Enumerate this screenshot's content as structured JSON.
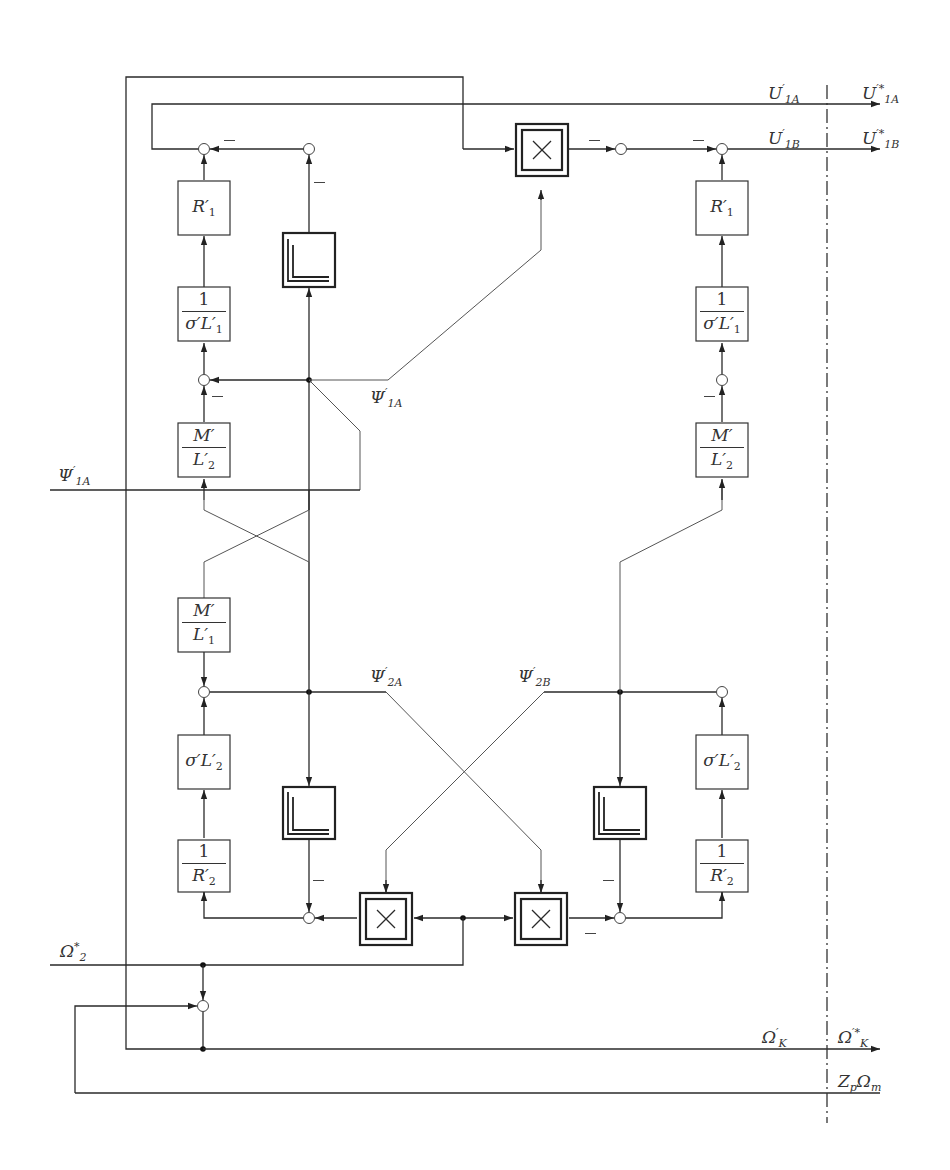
{
  "diagram": {
    "blocks": {
      "r1_left": {
        "label": "R",
        "prime": "′",
        "sub": "1"
      },
      "r1_right": {
        "label": "R",
        "prime": "′",
        "sub": "1"
      },
      "inv_sigma_l1_left": {
        "num": "1",
        "den": "σ′L′",
        "den_sub": "1"
      },
      "inv_sigma_l1_right": {
        "num": "1",
        "den": "σ′L′",
        "den_sub": "1"
      },
      "m_l2_left": {
        "num": "M′",
        "den": "L′",
        "den_sub": "2"
      },
      "m_l2_right": {
        "num": "M′",
        "den": "L′",
        "den_sub": "2"
      },
      "m_l1_left": {
        "num": "M′",
        "den": "L′",
        "den_sub": "1"
      },
      "sigma_l2_left": {
        "label": "σ′L′",
        "sub": "2"
      },
      "sigma_l2_right": {
        "label": "σ′L′",
        "sub": "2"
      },
      "inv_r2_left": {
        "num": "1",
        "den": "R′",
        "den_sub": "2"
      },
      "inv_r2_right": {
        "num": "1",
        "den": "R′",
        "den_sub": "2"
      },
      "integrator_top": {
        "type": "integrator"
      },
      "integrator_bottom_left": {
        "type": "integrator"
      },
      "integrator_bottom_right": {
        "type": "integrator"
      },
      "multiplier_top": {
        "type": "multiplier",
        "symbol": "×"
      },
      "multiplier_bottom_left": {
        "type": "multiplier",
        "symbol": "×"
      },
      "multiplier_bottom_right": {
        "type": "multiplier",
        "symbol": "×"
      }
    },
    "signals": {
      "u1a": {
        "main": "U",
        "sup": "′",
        "sub": "1A"
      },
      "u1a_star": {
        "main": "U",
        "sup": "′*",
        "sub": "1A"
      },
      "u1b": {
        "main": "U",
        "sup": "′",
        "sub": "1B"
      },
      "u1b_star": {
        "main": "U",
        "sup": "′*",
        "sub": "1B"
      },
      "psi1a_mid": {
        "main": "Ψ",
        "sup": "′",
        "sub": "1A"
      },
      "psi1a_in": {
        "main": "Ψ",
        "sup": "′",
        "sub": "1A"
      },
      "psi2a": {
        "main": "Ψ",
        "sup": "′",
        "sub": "2A"
      },
      "psi2b": {
        "main": "Ψ",
        "sup": "′",
        "sub": "2B"
      },
      "omega2_star": {
        "main": "Ω",
        "sup": "*",
        "sub": "2"
      },
      "omegak": {
        "main": "Ω",
        "sup": "′",
        "sub": "K"
      },
      "omegak_star": {
        "main": "Ω",
        "sup": "′*",
        "sub": "K"
      },
      "zp_omega_m": {
        "main": "Z",
        "sub": "p",
        "main2": "Ω",
        "sub2": "m"
      }
    },
    "signs": {
      "minus": "−"
    },
    "colors": {
      "line": "#2a2a2a",
      "block_border": "#333333",
      "background": "#ffffff"
    }
  }
}
